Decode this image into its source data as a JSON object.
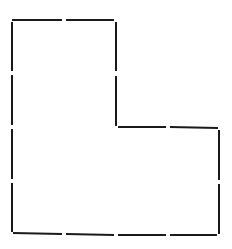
{
  "diagram": {
    "shape": "L-shaped polyomino outline",
    "stroke_color": "#1a1a1a",
    "background": "#ffffff",
    "grid_units": {
      "cols": 4,
      "rows": 4
    },
    "vertices": [
      [
        0,
        0
      ],
      [
        2,
        0
      ],
      [
        2,
        2
      ],
      [
        4,
        2
      ],
      [
        4,
        4
      ],
      [
        0,
        4
      ]
    ],
    "segments": [
      {
        "x1": 12,
        "y1": 20,
        "x2": 62,
        "y2": 20
      },
      {
        "x1": 66,
        "y1": 20,
        "x2": 114,
        "y2": 20
      },
      {
        "x1": 116,
        "y1": 22,
        "x2": 116,
        "y2": 71
      },
      {
        "x1": 116,
        "y1": 76,
        "x2": 116,
        "y2": 126
      },
      {
        "x1": 118,
        "y1": 127,
        "x2": 166,
        "y2": 127
      },
      {
        "x1": 170,
        "y1": 127,
        "x2": 218,
        "y2": 128
      },
      {
        "x1": 219,
        "y1": 130,
        "x2": 219,
        "y2": 180
      },
      {
        "x1": 219,
        "y1": 184,
        "x2": 219,
        "y2": 234
      },
      {
        "x1": 217,
        "y1": 235,
        "x2": 170,
        "y2": 235
      },
      {
        "x1": 166,
        "y1": 235,
        "x2": 118,
        "y2": 235
      },
      {
        "x1": 114,
        "y1": 235,
        "x2": 66,
        "y2": 234
      },
      {
        "x1": 62,
        "y1": 234,
        "x2": 13,
        "y2": 233
      },
      {
        "x1": 12,
        "y1": 232,
        "x2": 12,
        "y2": 183
      },
      {
        "x1": 12,
        "y1": 179,
        "x2": 12,
        "y2": 129
      },
      {
        "x1": 12,
        "y1": 125,
        "x2": 12,
        "y2": 75
      },
      {
        "x1": 12,
        "y1": 71,
        "x2": 12,
        "y2": 22
      }
    ]
  }
}
